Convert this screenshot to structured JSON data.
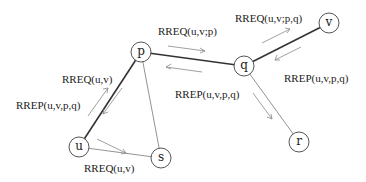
{
  "diagram": {
    "nodes": {
      "p": {
        "label": "p",
        "x": 141,
        "y": 52
      },
      "q": {
        "label": "q",
        "x": 244,
        "y": 66
      },
      "v": {
        "label": "v",
        "x": 329,
        "y": 23
      },
      "u": {
        "label": "u",
        "x": 79,
        "y": 147
      },
      "s": {
        "label": "s",
        "x": 161,
        "y": 158
      },
      "r": {
        "label": "r",
        "x": 299,
        "y": 142
      }
    },
    "edges": [
      {
        "from": "p",
        "to": "q",
        "style": "thick"
      },
      {
        "from": "q",
        "to": "v",
        "style": "thick"
      },
      {
        "from": "p",
        "to": "u",
        "style": "thick"
      },
      {
        "from": "u",
        "to": "s",
        "style": "thin"
      },
      {
        "from": "p",
        "to": "s",
        "style": "thin"
      },
      {
        "from": "q",
        "to": "r",
        "style": "thin"
      }
    ],
    "messages": {
      "rreq_u_p": "RREQ(u,v)",
      "rrep_p_u": "RREP(u,v,p,q)",
      "rreq_u_s": "RREQ(u,v)",
      "rreq_p_q": "RREQ(u,v;p)",
      "rrep_q_p": "RREP(u,v,p,q)",
      "rreq_q_v": "RREQ(u,v;p,q)",
      "rrep_v_q": "RREP(u,v,p,q)"
    }
  }
}
